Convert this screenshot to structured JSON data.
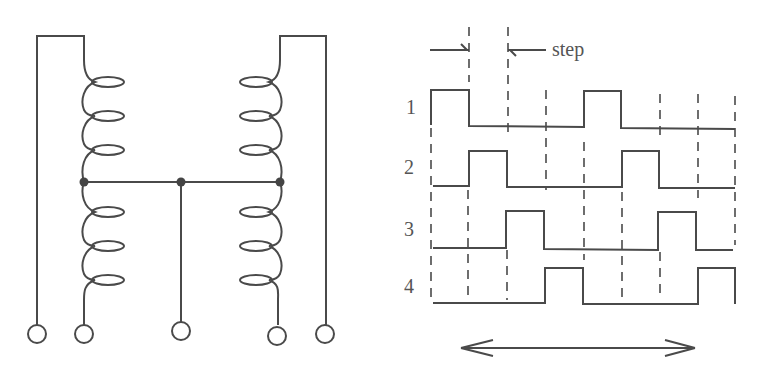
{
  "diagram": {
    "type": "stepper-motor-winding-and-timing",
    "left_panel": {
      "description": "Unipolar (center-tapped) two-coil winding with 5 terminals",
      "coils": [
        {
          "name": "left-coil",
          "turns_upper": 3,
          "turns_lower": 3
        },
        {
          "name": "right-coil",
          "turns_upper": 3,
          "turns_lower": 3
        }
      ],
      "junctions": 3,
      "terminals": 5
    },
    "right_panel": {
      "step_label": "step",
      "phases": [
        {
          "label": "1",
          "pulses_at_steps": [
            0,
            4
          ]
        },
        {
          "label": "2",
          "pulses_at_steps": [
            1,
            5
          ]
        },
        {
          "label": "3",
          "pulses_at_steps": [
            2,
            6
          ]
        },
        {
          "label": "4",
          "pulses_at_steps": [
            3,
            7
          ]
        }
      ],
      "total_steps": 8,
      "bottom_arrow": "double-headed-arrow"
    }
  }
}
